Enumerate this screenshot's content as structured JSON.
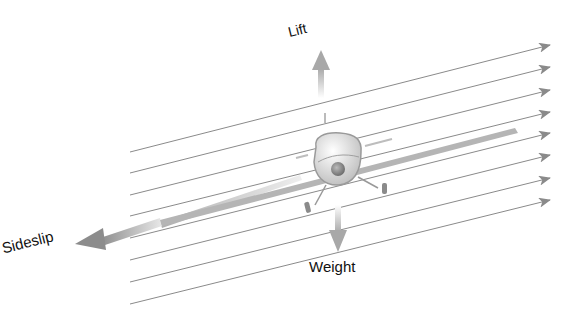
{
  "diagram": {
    "labels": {
      "lift": "Lift",
      "weight": "Weight",
      "sideslip": "Sideslip"
    },
    "airflow_lines": {
      "count": 8,
      "left_x": 130,
      "right_x": 550,
      "left_y": [
        152,
        173,
        195,
        216,
        238,
        260,
        282,
        304
      ],
      "right_y": [
        45,
        67,
        90,
        112,
        133,
        155,
        178,
        200
      ]
    },
    "colors": {
      "airflow": "#8a8a8a",
      "force_arrow": "#9a9a9a",
      "aircraft_body": "#dcdcdc",
      "wing": "#b5b5b5",
      "text": "#111111"
    }
  }
}
